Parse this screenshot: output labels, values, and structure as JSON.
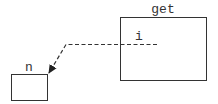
{
  "diagram": {
    "nodes": [
      {
        "id": "get",
        "label": "get",
        "x": 120,
        "y": 17,
        "w": 86,
        "h": 63
      },
      {
        "id": "n",
        "label": "n",
        "x": 11,
        "y": 74,
        "w": 36,
        "h": 26
      }
    ],
    "edges": [
      {
        "from": "get",
        "to": "n",
        "label": "i",
        "style": "dashed",
        "arrow": "filled"
      }
    ],
    "colors": {
      "stroke": "#333333",
      "background": "#ffffff"
    }
  }
}
